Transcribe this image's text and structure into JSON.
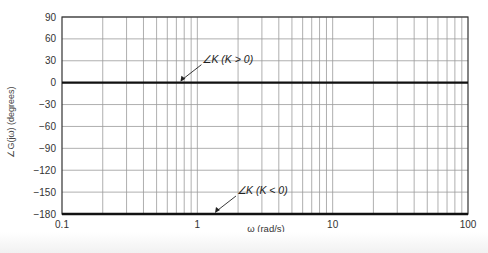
{
  "chart_data": {
    "type": "line",
    "title": "",
    "xlabel": "ω (rad/s)",
    "ylabel": "∠G(jω) (degrees)",
    "xscale": "log",
    "xlim": [
      0.1,
      100
    ],
    "ylim": [
      -180,
      90
    ],
    "x_ticks": [
      "0.1",
      "1",
      "10",
      "100"
    ],
    "y_ticks": [
      "90",
      "60",
      "30",
      "0",
      "-30",
      "-60",
      "-90",
      "-120",
      "-150",
      "-180"
    ],
    "grid": true,
    "series": [
      {
        "name": "∠K (K > 0)",
        "x": [
          0.1,
          100
        ],
        "values": [
          0,
          0
        ]
      },
      {
        "name": "∠K (K < 0)",
        "x": [
          0.1,
          100
        ],
        "values": [
          -180,
          -180
        ]
      }
    ],
    "annotations": [
      {
        "text": "∠K (K > 0)",
        "points_to": {
          "x": 0.75,
          "y": 0
        }
      },
      {
        "text": "∠K (K < 0)",
        "points_to": {
          "x": 1.35,
          "y": -180
        }
      }
    ]
  }
}
